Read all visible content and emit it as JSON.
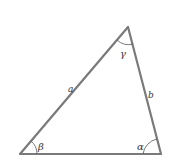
{
  "diagram": {
    "type": "triangle",
    "vertices": {
      "bottom_left": {
        "x": 20,
        "y": 154
      },
      "top": {
        "x": 128,
        "y": 27
      },
      "bottom_right": {
        "x": 161,
        "y": 154
      }
    },
    "sides": {
      "a": {
        "label": "a",
        "between": [
          "bottom_left",
          "top"
        ]
      },
      "b": {
        "label": "b",
        "between": [
          "top",
          "bottom_right"
        ]
      },
      "c": {
        "label": "",
        "between": [
          "bottom_left",
          "bottom_right"
        ]
      }
    },
    "angles": {
      "beta": {
        "label": "β",
        "vertex": "bottom_left"
      },
      "gamma": {
        "label": "γ",
        "vertex": "top"
      },
      "alpha": {
        "label": "α",
        "vertex": "bottom_right"
      }
    },
    "colors": {
      "stroke": "#7a7a7a",
      "text": "#333333",
      "background": "#ffffff"
    }
  }
}
